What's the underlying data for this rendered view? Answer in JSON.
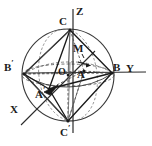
{
  "figure": {
    "background": "#ffffff",
    "ink": "#1a1a1a",
    "canvas": {
      "width": 152,
      "height": 146
    }
  },
  "sphere": {
    "name": "great-circle-outline",
    "center": {
      "x": 68,
      "y": 75
    },
    "radius": 46,
    "stroke": "#333333"
  },
  "equator_ellipse": {
    "name": "equatorial-great-circle",
    "cx": 68,
    "cy": 75,
    "rx": 46,
    "ry": 11,
    "dashed": true
  },
  "axes": [
    {
      "label": "Z",
      "name": "axis-z",
      "x1": 73,
      "y1": 133,
      "x2": 73,
      "y2": 8,
      "label_x": 78,
      "label_y": 9
    },
    {
      "label": "Y",
      "name": "axis-y",
      "x1": 30,
      "y1": 73,
      "x2": 145,
      "y2": 72,
      "label_x": 126,
      "label_y": 66
    },
    {
      "label": "X",
      "name": "axis-x",
      "x1": 92,
      "y1": 54,
      "x2": 22,
      "y2": 124,
      "label_x": 11,
      "label_y": 106
    }
  ],
  "points": [
    {
      "id": "C",
      "label": "C",
      "prime": false,
      "x": 70,
      "y": 29,
      "label_x": 60,
      "label_y": 20
    },
    {
      "id": "Cp",
      "label": "C",
      "prime": true,
      "x": 68,
      "y": 122,
      "label_x": 61,
      "label_y": 124
    },
    {
      "id": "B",
      "label": "B",
      "prime": false,
      "x": 113,
      "y": 73,
      "label_x": 112,
      "label_y": 66
    },
    {
      "id": "Bp",
      "label": "B",
      "prime": true,
      "x": 23,
      "y": 74,
      "label_x": 6,
      "label_y": 62
    },
    {
      "id": "A",
      "label": "A",
      "prime": false,
      "x": 84,
      "y": 71,
      "label_x": 77,
      "label_y": 70
    },
    {
      "id": "Ap",
      "label": "A",
      "prime": true,
      "x": 49,
      "y": 89,
      "label_x": 36,
      "label_y": 86
    },
    {
      "id": "O",
      "label": "O",
      "prime": false,
      "x": 68,
      "y": 75,
      "label_x": 59,
      "label_y": 69
    },
    {
      "id": "M",
      "label": "M",
      "prime": false,
      "x": 83,
      "y": 57,
      "label_x": 74,
      "label_y": 45
    }
  ],
  "vector": {
    "name": "vector-m-to-a",
    "from": {
      "x": 78,
      "y": 62
    },
    "to": {
      "x": 90,
      "y": 66
    },
    "label": "arrow"
  },
  "edges_solid": [
    [
      "C",
      "B"
    ],
    [
      "C",
      "Bp"
    ],
    [
      "C",
      "Ap"
    ],
    [
      "C",
      "O"
    ],
    [
      "Cp",
      "B"
    ],
    [
      "Cp",
      "Bp"
    ],
    [
      "Cp",
      "Ap"
    ],
    [
      "Bp",
      "Ap"
    ],
    [
      "Ap",
      "B"
    ],
    [
      "Bp",
      "B"
    ]
  ],
  "edges_dashed": [
    [
      "C",
      "A"
    ],
    [
      "Cp",
      "A"
    ],
    [
      "Bp",
      "A"
    ],
    [
      "A",
      "B"
    ],
    [
      "O",
      "Cp"
    ],
    [
      "O",
      "A"
    ]
  ],
  "legend": {
    "solid_meaning": "front edges",
    "dashed_meaning": "hidden / back edges"
  }
}
